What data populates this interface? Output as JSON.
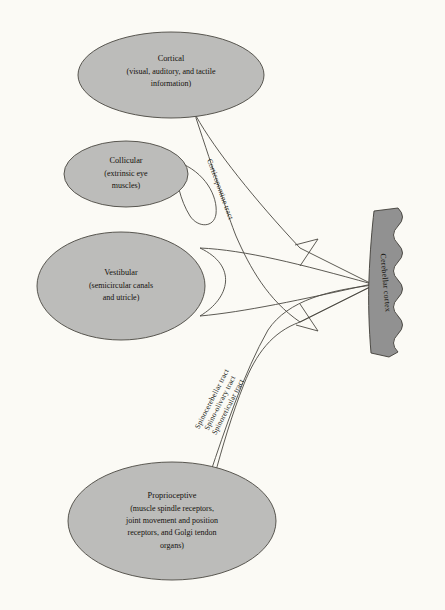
{
  "figure": {
    "background_color": "#fbfaf5",
    "node_fill_color": "#bcbcba",
    "node_stroke_color": "#4a4741",
    "cortex_fill_color": "#919191",
    "cortex_stroke_color": "#3f3d38",
    "tract_stroke_color": "#4a4741"
  },
  "nodes": [
    {
      "id": "cortical",
      "title": "Cortical",
      "sub_lines": [
        "(visual, auditory, and tactile",
        "information)"
      ]
    },
    {
      "id": "collicular",
      "title": "Collicular",
      "sub_lines": [
        "(extrinsic eye",
        "muscles)"
      ]
    },
    {
      "id": "vestibular",
      "title": "Vestibular",
      "sub_lines": [
        "(semicircular canals",
        "and utricle)"
      ]
    },
    {
      "id": "proprioceptive",
      "title": "Proprioceptive",
      "sub_lines": [
        "(muscle spindle receptors,",
        "joint movement and position",
        "receptors, and Golgi tendon",
        "organs)"
      ]
    }
  ],
  "tracts": [
    {
      "id": "corticopontine",
      "label": "Corticopontine tract"
    },
    {
      "id": "spinocerebellar",
      "label": "Spinocerebellar tract"
    },
    {
      "id": "spino-olivary",
      "label": "Spino-olivary tract"
    },
    {
      "id": "spinoreticular",
      "label": "Spinoreticular tract"
    }
  ],
  "target": {
    "id": "cerebellar-cortex",
    "label": "Cerebellar cortex"
  }
}
